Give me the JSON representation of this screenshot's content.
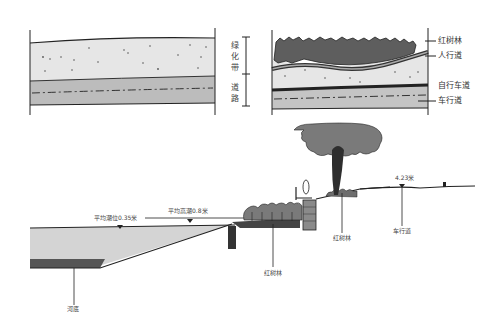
{
  "plan_left": {
    "labels": [
      "绿化带",
      "道路"
    ],
    "green_belt_label": "绿化带",
    "road_label": "道路"
  },
  "plan_right": {
    "labels": [
      "红树林",
      "人行道",
      "自行车道",
      "车行道"
    ],
    "mangrove_label": "红树林",
    "sidewalk_label": "人行道",
    "bike_lane_label": "自行车道",
    "roadway_label": "车行道"
  },
  "section": {
    "mean_tide_label": "平均潮位0.35米",
    "mean_high_tide_label": "平均高潮0.8米",
    "road_elevation_label": "4.23米",
    "riverbed_label": "河底",
    "mangrove_lower_label": "红树林",
    "mangrove_upper_label": "红树林",
    "roadway_label": "车行道"
  },
  "colors": {
    "water": "#d4d4d4",
    "riverbed": "#555555",
    "foliage": "#7a7a7a",
    "trunk": "#2e2e2e",
    "light_band": "#e8e8e8",
    "road_band": "#bdbdbd",
    "ink": "#222222"
  }
}
